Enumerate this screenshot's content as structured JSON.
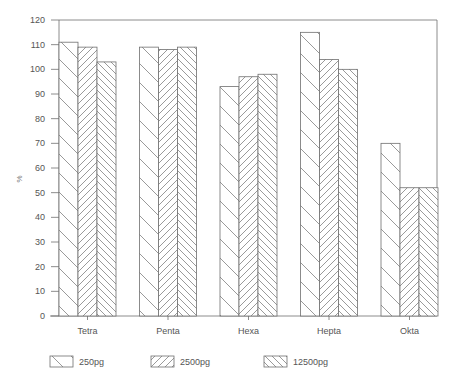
{
  "chart_data": {
    "type": "bar",
    "title": "",
    "xlabel": "",
    "ylabel": "%",
    "ylim": [
      0,
      120
    ],
    "yticks": [
      0,
      10,
      20,
      30,
      40,
      50,
      60,
      70,
      80,
      90,
      100,
      110,
      120
    ],
    "grid": false,
    "legend_position": "bottom",
    "categories": [
      "Tetra",
      "Penta",
      "Hexa",
      "Hepta",
      "Okta"
    ],
    "series": [
      {
        "name": "250pg",
        "pattern": "wide-backslash",
        "values": [
          111,
          109,
          93,
          115,
          70
        ]
      },
      {
        "name": "2500pg",
        "pattern": "dense-slash",
        "values": [
          109,
          108,
          97,
          104,
          52
        ]
      },
      {
        "name": "12500pg",
        "pattern": "dense-backslash",
        "values": [
          103,
          109,
          98,
          100,
          52
        ]
      }
    ]
  },
  "colors": {
    "line": "#6f6f6f",
    "text": "#555555",
    "background": "#ffffff"
  }
}
